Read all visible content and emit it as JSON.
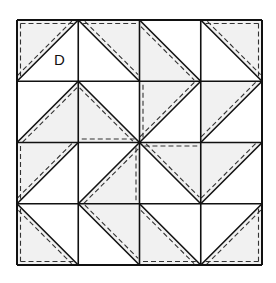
{
  "diagram": {
    "type": "quilt-block-layout",
    "grid": {
      "rows": 4,
      "cols": 4,
      "origin_x": 17,
      "origin_y": 20,
      "cell": 61.25
    },
    "colors": {
      "line": "#111111",
      "shade": "#f1f1f1",
      "background": "#ffffff",
      "seam": "#333333"
    },
    "label": {
      "text": "D",
      "row": 0,
      "col": 0
    },
    "cells": [
      {
        "r": 0,
        "c": 0,
        "diag": "/",
        "shade": "tl",
        "dash": [
          "diag",
          "top",
          "left"
        ]
      },
      {
        "r": 0,
        "c": 1,
        "diag": "\\",
        "shade": "tr",
        "dash": [
          "diag",
          "top"
        ]
      },
      {
        "r": 0,
        "c": 2,
        "diag": "\\",
        "shade": "bl",
        "dash": [
          "diag"
        ]
      },
      {
        "r": 0,
        "c": 3,
        "diag": "\\",
        "shade": "tr",
        "dash": [
          "diag",
          "top",
          "right"
        ]
      },
      {
        "r": 1,
        "c": 0,
        "diag": "/",
        "shade": "br",
        "dash": [
          "diag"
        ]
      },
      {
        "r": 1,
        "c": 1,
        "diag": "\\",
        "shade": "bl",
        "dash": [
          "diag",
          "bottom"
        ]
      },
      {
        "r": 1,
        "c": 2,
        "diag": "/",
        "shade": "tl",
        "dash": [
          "diag",
          "left"
        ]
      },
      {
        "r": 1,
        "c": 3,
        "diag": "/",
        "shade": "tl",
        "dash": [
          "diag"
        ]
      },
      {
        "r": 2,
        "c": 0,
        "diag": "/",
        "shade": "tl",
        "dash": [
          "diag",
          "left"
        ]
      },
      {
        "r": 2,
        "c": 1,
        "diag": "/",
        "shade": "br",
        "dash": [
          "diag",
          "right"
        ]
      },
      {
        "r": 2,
        "c": 2,
        "diag": "\\",
        "shade": "tr",
        "dash": [
          "diag",
          "top"
        ]
      },
      {
        "r": 2,
        "c": 3,
        "diag": "/",
        "shade": "tl",
        "dash": [
          "diag"
        ]
      },
      {
        "r": 3,
        "c": 0,
        "diag": "\\",
        "shade": "bl",
        "dash": [
          "diag",
          "left",
          "bottom"
        ]
      },
      {
        "r": 3,
        "c": 1,
        "diag": "\\",
        "shade": "tr",
        "dash": [
          "diag"
        ]
      },
      {
        "r": 3,
        "c": 2,
        "diag": "\\",
        "shade": "bl",
        "dash": [
          "diag",
          "bottom"
        ]
      },
      {
        "r": 3,
        "c": 3,
        "diag": "/",
        "shade": "br",
        "dash": [
          "diag",
          "bottom",
          "right"
        ]
      }
    ]
  }
}
